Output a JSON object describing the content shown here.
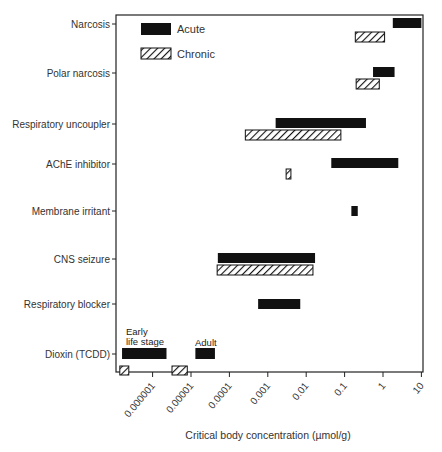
{
  "chart_data": {
    "type": "bar",
    "orientation": "horizontal-range",
    "title": "",
    "xlabel": "Critical body concentration (µmol/g)",
    "ylabel": "",
    "xscale": "log",
    "xlim": [
      1e-07,
      10
    ],
    "x_ticks": [
      1e-06,
      1e-05,
      0.0001,
      0.001,
      0.01,
      0.1,
      1,
      10
    ],
    "x_tick_labels": [
      "0.000001",
      "0.00001",
      "0.0001",
      "0.001",
      "0.01",
      "0.1",
      "1",
      "10"
    ],
    "grid": false,
    "legend": {
      "position": "upper-left",
      "entries": [
        {
          "name": "Acute",
          "style": "solid-black"
        },
        {
          "name": "Chronic",
          "style": "hatched"
        }
      ]
    },
    "categories": [
      "Narcosis",
      "Polar narcosis",
      "Respiratory uncoupler",
      "AChE inhibitor",
      "Membrane irritant",
      "CNS seizure",
      "Respiratory blocker",
      "Dioxin (TCDD)"
    ],
    "series": [
      {
        "name": "Acute",
        "ranges": [
          {
            "category": "Narcosis",
            "min": 1.8,
            "max": 10
          },
          {
            "category": "Polar narcosis",
            "min": 0.55,
            "max": 2
          },
          {
            "category": "Respiratory uncoupler",
            "min": 0.0016,
            "max": 0.36
          },
          {
            "category": "AChE inhibitor",
            "min": 0.045,
            "max": 2.5
          },
          {
            "category": "Membrane irritant",
            "min": 0.15,
            "max": 0.22
          },
          {
            "category": "CNS seizure",
            "min": 5e-05,
            "max": 0.017
          },
          {
            "category": "Respiratory blocker",
            "min": 0.00056,
            "max": 0.007
          },
          {
            "category": "Dioxin (TCDD)",
            "label": "Early life stage",
            "min": 1.6e-07,
            "max": 2.3e-06
          },
          {
            "category": "Dioxin (TCDD)",
            "label": "Adult",
            "min": 1.3e-05,
            "max": 4.2e-05
          }
        ]
      },
      {
        "name": "Chronic",
        "ranges": [
          {
            "category": "Narcosis",
            "min": 0.19,
            "max": 1.1
          },
          {
            "category": "Polar narcosis",
            "min": 0.2,
            "max": 0.8
          },
          {
            "category": "Respiratory uncoupler",
            "min": 0.00026,
            "max": 0.08
          },
          {
            "category": "AChE inhibitor",
            "min": 0.003,
            "max": 0.004
          },
          {
            "category": "CNS seizure",
            "min": 4.8e-05,
            "max": 0.015
          },
          {
            "category": "Dioxin (TCDD)",
            "label": "Early life stage",
            "min": 1.4e-07,
            "max": 2.4e-07
          },
          {
            "category": "Dioxin (TCDD)",
            "label": "Adult",
            "min": 3.2e-06,
            "max": 8e-06
          }
        ]
      }
    ],
    "annotations": [
      "Early life stage",
      "Adult"
    ]
  },
  "labels": {
    "legend_acute": "Acute",
    "legend_chronic": "Chronic",
    "ann_early_1": "Early",
    "ann_early_2": "life stage",
    "ann_adult": "Adult"
  }
}
